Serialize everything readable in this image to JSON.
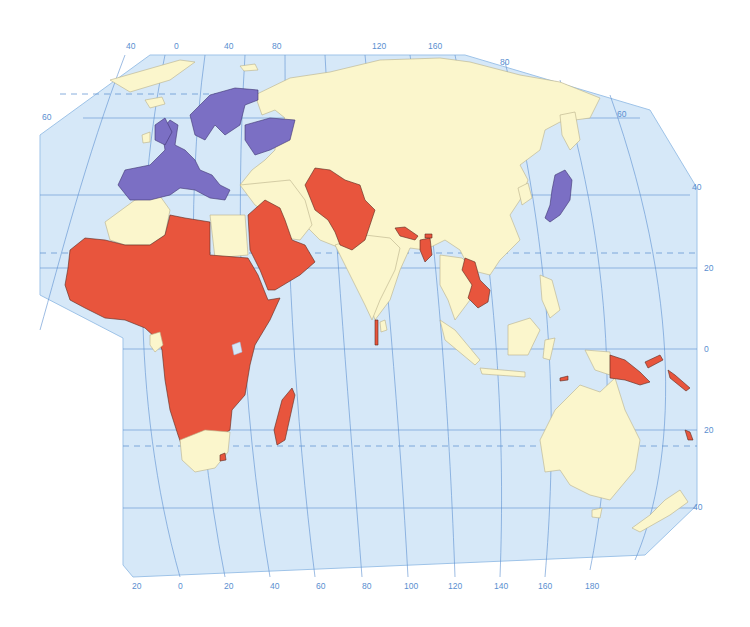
{
  "map": {
    "colors": {
      "ocean": "#d6e8f8",
      "grid": "#5a8fd0",
      "neutral_land": "#fbf6cc",
      "category_red": "#e8553d",
      "category_purple": "#7b6fc4",
      "label": "#5a8fd0"
    },
    "top_longitude_labels": [
      "40",
      "0",
      "40",
      "80",
      "120",
      "160"
    ],
    "bottom_longitude_labels": [
      "20",
      "0",
      "20",
      "40",
      "60",
      "80",
      "100",
      "120",
      "140",
      "160",
      "180"
    ],
    "left_latitude_labels": [
      "60"
    ],
    "right_latitude_labels": [
      "80",
      "60",
      "40",
      "20",
      "0",
      "20",
      "40"
    ],
    "categories": [
      {
        "name": "purple",
        "color": "#7b6fc4",
        "regions": [
          "Western Europe",
          "Scandinavia",
          "Ukraine region",
          "Japan"
        ]
      },
      {
        "name": "red",
        "color": "#e8553d",
        "regions": [
          "Sub-Saharan Africa",
          "Arabian Peninsula",
          "Central Asia & Afghanistan/Pakistan",
          "Nepal",
          "Bangladesh",
          "Laos/Cambodia",
          "Maldives",
          "Madagascar",
          "Papua New Guinea",
          "Solomon Islands",
          "Vanuatu",
          "Timor-Leste"
        ]
      },
      {
        "name": "neutral",
        "color": "#fbf6cc",
        "regions": [
          "Russia",
          "China",
          "India",
          "Australia",
          "North Africa",
          "Middle East",
          "Southeast Asia",
          "New Zealand"
        ]
      }
    ]
  }
}
